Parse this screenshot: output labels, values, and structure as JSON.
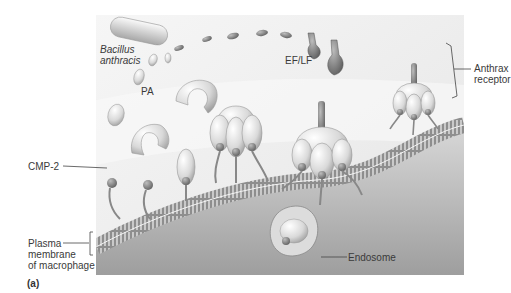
{
  "figure": {
    "panel_tag": "(a)",
    "labels": {
      "bacillus_line1": "Bacillus",
      "bacillus_line2": "anthracis",
      "pa": "PA",
      "ef_lf": "EF/LF",
      "anthrax_receptor_line1": "Anthrax",
      "anthrax_receptor_line2": "receptor",
      "cmp2": "CMP-2",
      "plasma_line1": "Plasma",
      "plasma_line2": "membrane",
      "plasma_line3": "of macrophage",
      "endosome": "Endosome"
    },
    "colors": {
      "background": "#ffffff",
      "extracellular": "#efefef",
      "cytoplasm": "#c9c9c9",
      "protein_light": "#e6e6e6",
      "protein_dark": "#8a8a8a",
      "leader_line": "#444444",
      "label_text": "#3a3a3a"
    }
  }
}
